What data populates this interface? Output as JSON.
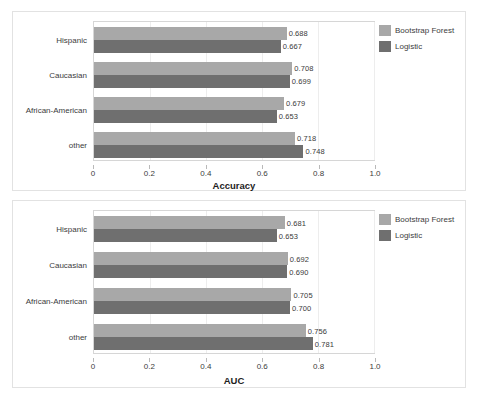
{
  "legend": {
    "entries": [
      {
        "label": "Bootstrap Forest",
        "color": "#a8a8a8"
      },
      {
        "label": "Logistic",
        "color": "#6f6f6f"
      }
    ]
  },
  "axis": {
    "ticks": [
      "0",
      "0.2",
      "0.4",
      "0.6",
      "0.8",
      "1.0"
    ],
    "tick_values": [
      0,
      0.2,
      0.4,
      0.6,
      0.8,
      1.0
    ]
  },
  "chart_data": [
    {
      "type": "bar",
      "orientation": "horizontal",
      "title": "",
      "xlabel": "Accuracy",
      "ylabel": "",
      "xlim": [
        0,
        1.0
      ],
      "grid": true,
      "legend_position": "right",
      "categories": [
        "Hispanic",
        "Caucasian",
        "African-American",
        "other"
      ],
      "series": [
        {
          "name": "Bootstrap Forest",
          "color": "#a8a8a8",
          "values": [
            0.688,
            0.708,
            0.679,
            0.718
          ]
        },
        {
          "name": "Logistic",
          "color": "#6f6f6f",
          "values": [
            0.667,
            0.699,
            0.653,
            0.748
          ]
        }
      ],
      "value_labels": [
        [
          "0.688",
          "0.667"
        ],
        [
          "0.708",
          "0.699"
        ],
        [
          "0.679",
          "0.653"
        ],
        [
          "0.718",
          "0.748"
        ]
      ]
    },
    {
      "type": "bar",
      "orientation": "horizontal",
      "title": "",
      "xlabel": "AUC",
      "ylabel": "",
      "xlim": [
        0,
        1.0
      ],
      "grid": true,
      "legend_position": "right",
      "categories": [
        "Hispanic",
        "Caucasian",
        "African-American",
        "other"
      ],
      "series": [
        {
          "name": "Bootstrap Forest",
          "color": "#a8a8a8",
          "values": [
            0.681,
            0.692,
            0.705,
            0.756
          ]
        },
        {
          "name": "Logistic",
          "color": "#6f6f6f",
          "values": [
            0.653,
            0.69,
            0.7,
            0.781
          ]
        }
      ],
      "value_labels": [
        [
          "0.681",
          "0.653"
        ],
        [
          "0.692",
          "0.690"
        ],
        [
          "0.705",
          "0.700"
        ],
        [
          "0.756",
          "0.781"
        ]
      ]
    }
  ]
}
